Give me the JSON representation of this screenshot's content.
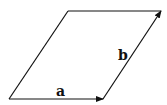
{
  "diagram": {
    "type": "parallelogram-vectors",
    "vectors": [
      {
        "name": "a",
        "label": "a",
        "from": [
          9,
          99
        ],
        "to": [
          103,
          99
        ]
      },
      {
        "name": "b",
        "label": "b",
        "from": [
          103,
          99
        ],
        "to": [
          161,
          11
        ]
      }
    ],
    "edges": [
      {
        "from": [
          9,
          99
        ],
        "to": [
          68,
          11
        ]
      },
      {
        "from": [
          68,
          11
        ],
        "to": [
          161,
          11
        ]
      }
    ],
    "stroke_color": "#111111"
  }
}
